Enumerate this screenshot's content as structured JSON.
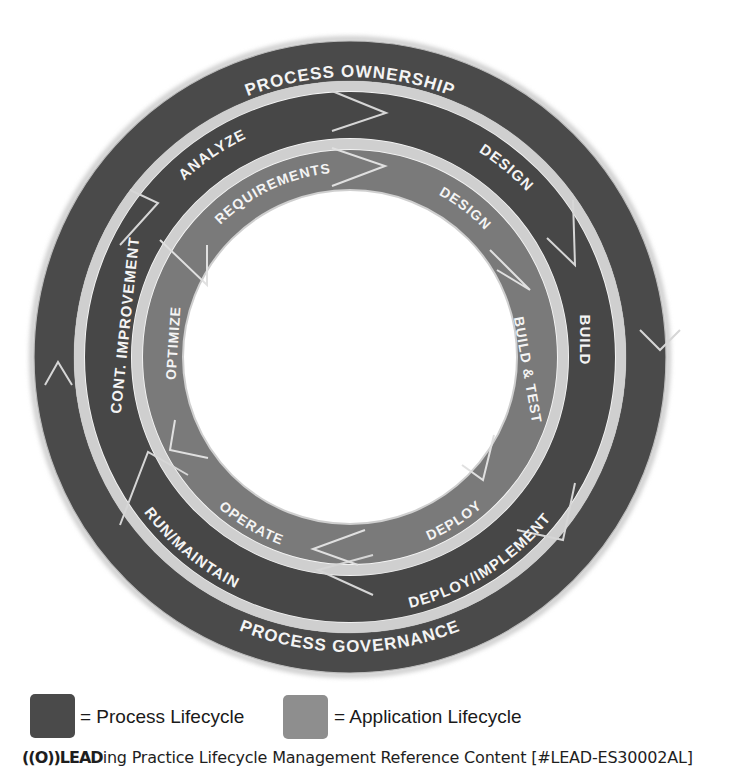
{
  "diagram": {
    "center": [
      350,
      357
    ],
    "colors": {
      "process": "#4a4a4a",
      "application": "#7c7c7c",
      "separator": "#d9d9d9",
      "label": "#f4f4f4",
      "background": "#ffffff"
    },
    "outer_ring": {
      "top_label": "PROCESS OWNERSHIP",
      "bottom_label": "PROCESS GOVERNANCE"
    },
    "process_ring": {
      "segments": [
        {
          "label": "ANALYZE"
        },
        {
          "label": "DESIGN"
        },
        {
          "label": "BUILD"
        },
        {
          "label": "DEPLOY/IMPLEMENT"
        },
        {
          "label": "RUN/MAINTAIN"
        },
        {
          "label": "CONT. IMPROVEMENT"
        }
      ]
    },
    "application_ring": {
      "segments": [
        {
          "label": "REQUIREMENTS"
        },
        {
          "label": "DESIGN"
        },
        {
          "label": "BUILD & TEST"
        },
        {
          "label": "DEPLOY"
        },
        {
          "label": "OPERATE"
        },
        {
          "label": "OPTIMIZE"
        }
      ]
    }
  },
  "legend": {
    "items": [
      {
        "label": "= Process Lifecycle",
        "color": "#4a4a4a"
      },
      {
        "label": "= Application Lifecycle",
        "color": "#8e8e8e"
      }
    ]
  },
  "footer": {
    "logo": "((O))LEAD",
    "text": "ing Practice Lifecycle Management Reference Content [#LEAD-ES30002AL]"
  }
}
